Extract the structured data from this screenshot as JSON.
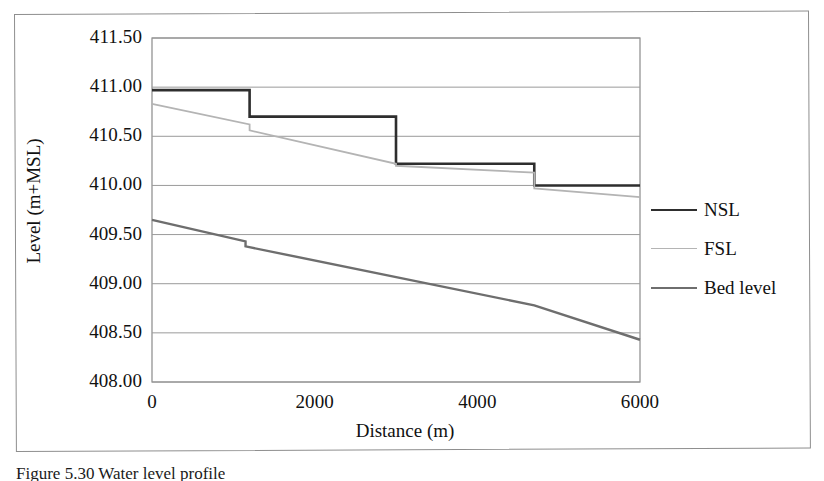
{
  "figure": {
    "caption": "Figure 5.30  Water level profile"
  },
  "chart_data": {
    "type": "line",
    "title": "",
    "xlabel": "Distance (m)",
    "ylabel": "Level (m+MSL)",
    "xlim": [
      0,
      6000
    ],
    "ylim": [
      408.0,
      411.5
    ],
    "xticks": [
      0,
      2000,
      4000,
      6000
    ],
    "xtick_labels": [
      "0",
      "2000",
      "4000",
      "6000"
    ],
    "yticks": [
      408.0,
      408.5,
      409.0,
      409.5,
      410.0,
      410.5,
      411.0,
      411.5
    ],
    "ytick_labels": [
      "408.00",
      "408.50",
      "409.00",
      "409.50",
      "410.00",
      "410.50",
      "411.00",
      "411.50"
    ],
    "grid": "horizontal",
    "legend_position": "right",
    "series": [
      {
        "name": "NSL",
        "color": "#2e2e2e",
        "width": 2.6,
        "style": "step",
        "x": [
          0,
          1200,
          1200,
          3000,
          3000,
          4700,
          4700,
          6000
        ],
        "y": [
          410.97,
          410.97,
          410.7,
          410.7,
          410.22,
          410.22,
          410.0,
          410.0
        ]
      },
      {
        "name": "FSL",
        "color": "#b4b4b4",
        "width": 1.8,
        "style": "step-slope",
        "x": [
          0,
          1200,
          1200,
          3000,
          3000,
          4700,
          4700,
          6000
        ],
        "y": [
          410.83,
          410.62,
          410.56,
          410.22,
          410.2,
          410.13,
          409.97,
          409.88
        ]
      },
      {
        "name": "Bed level",
        "color": "#6e6e6e",
        "width": 2.4,
        "style": "line",
        "x": [
          0,
          1150,
          1150,
          4700,
          6000
        ],
        "y": [
          409.65,
          409.43,
          409.38,
          408.78,
          408.43
        ]
      }
    ]
  },
  "legend": {
    "items": [
      {
        "label": "NSL",
        "color": "#2e2e2e",
        "width": 2.6
      },
      {
        "label": "FSL",
        "color": "#b4b4b4",
        "width": 1.8
      },
      {
        "label": "Bed level",
        "color": "#6e6e6e",
        "width": 2.4
      }
    ]
  }
}
